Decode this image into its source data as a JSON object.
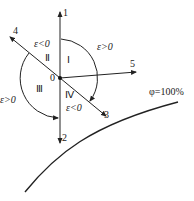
{
  "diagram": {
    "type": "enthalpy-humidity process direction diagram",
    "origin_label": "0",
    "axes": [
      {
        "id": "1",
        "label": "1",
        "direction": "up"
      },
      {
        "id": "2",
        "label": "2",
        "direction": "down"
      },
      {
        "id": "3",
        "label": "3",
        "direction": "down-right"
      },
      {
        "id": "4",
        "label": "4",
        "direction": "up-left"
      },
      {
        "id": "5",
        "label": "5",
        "direction": "right"
      }
    ],
    "regions": [
      {
        "id": "I",
        "label": "Ⅰ"
      },
      {
        "id": "II",
        "label": "Ⅱ"
      },
      {
        "id": "III",
        "label": "Ⅲ"
      },
      {
        "id": "IV",
        "label": "Ⅳ"
      }
    ],
    "epsilon_labels": {
      "region_I": "ε>0",
      "region_II": "ε<0",
      "region_III": "ε>0",
      "region_IV": "ε<0"
    },
    "curve_label": "φ=100%",
    "line_color": "#222222"
  }
}
